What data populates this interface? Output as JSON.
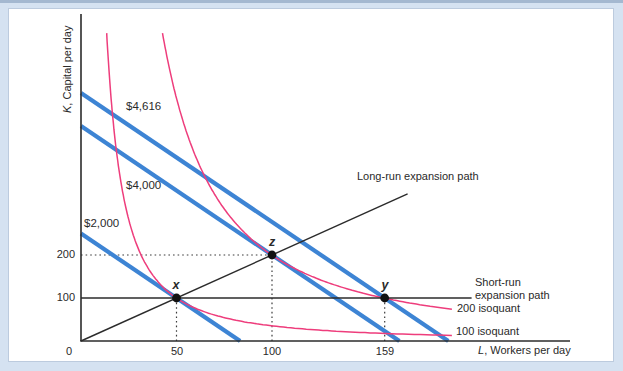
{
  "frame": {
    "background": "#d5e2f1",
    "panel_background": "#ffffff",
    "top_strip_color": "#a4b8d0",
    "panel_border_color": "#bccbde"
  },
  "chart_data": {
    "type": "line",
    "title": "",
    "xlabel_var": "L",
    "xlabel_rest": ", Workers per day",
    "ylabel_var": "K",
    "ylabel_rest": ", Capital per day",
    "x_ticks": [
      "0",
      "50",
      "100",
      "159"
    ],
    "x_tick_values": [
      0,
      50,
      100,
      159
    ],
    "y_ticks": [
      "100",
      "200"
    ],
    "y_tick_values": [
      100,
      200
    ],
    "xlim": [
      0,
      256
    ],
    "ylim": [
      0,
      760
    ],
    "grid": false,
    "colors": {
      "isocost": "#3d84d4",
      "isoquant": "#ee3d7c",
      "black_line": "#2b2b2b",
      "point": "#111111"
    },
    "isocosts": [
      {
        "label": "$2,000",
        "cost": 2000,
        "x_intercept_L": 83.3,
        "y_intercept_K": 250
      },
      {
        "label": "$4,000",
        "cost": 4000,
        "x_intercept_L": 166.7,
        "y_intercept_K": 500
      },
      {
        "label": "$4,616",
        "cost": 4616,
        "x_intercept_L": 192.3,
        "y_intercept_K": 577
      }
    ],
    "isoquants": [
      {
        "label": "100 isoquant",
        "q": 100
      },
      {
        "label": "200 isoquant",
        "q": 200
      }
    ],
    "production_function": {
      "A": 1.517,
      "alpha": 0.6,
      "beta": 0.4,
      "K_max_drawn": 716,
      "L_max_drawn": 194.2
    },
    "points": [
      {
        "name": "x",
        "L": 50,
        "K": 100
      },
      {
        "name": "z",
        "L": 100,
        "K": 200
      },
      {
        "name": "y",
        "L": 159,
        "K": 100
      }
    ],
    "guides": {
      "vertical": [
        {
          "L": 50,
          "to_K": 100
        },
        {
          "L": 100,
          "to_K": 200
        },
        {
          "L": 159,
          "to_K": 100
        }
      ],
      "horizontal": [
        {
          "K": 200,
          "to_L": 100
        }
      ]
    },
    "long_run_label": "Long-run expansion path",
    "short_run_label": "Short-run expansion path",
    "long_run_path": {
      "slope_K_per_L": 2,
      "from_L": 0,
      "to_L": 171
    },
    "short_run_path": {
      "K": 100,
      "from_L": 0,
      "to_L": 204.5
    },
    "legend_position": "none"
  }
}
